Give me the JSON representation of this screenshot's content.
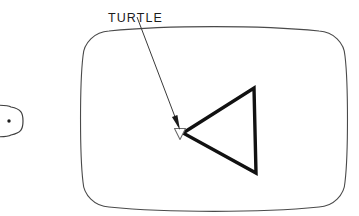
{
  "figure": {
    "background_color": "#ffffff",
    "annotation": {
      "label": "TURTLE",
      "label_x": 108,
      "label_y": 13,
      "leader_line": {
        "from_x": 137,
        "from_y": 17,
        "to_x": 180,
        "to_y": 129,
        "color": "#3a3a3a",
        "width": 1
      },
      "arrowhead": {
        "tip_x": 180,
        "tip_y": 130,
        "color": "#1a1a1a"
      }
    },
    "screen": {
      "name": "crt-screen",
      "outline_color": "#4a4a4a",
      "outline_width": 1.1,
      "fill": "#ffffff",
      "left": 83,
      "top": 30,
      "right": 345,
      "bottom": 208,
      "corner_radius": 26,
      "bow": 6
    },
    "turtle_cursor": {
      "name": "turtle-cursor",
      "shape": "triangle-down-outline",
      "center_x": 180,
      "center_y": 134,
      "size": 11,
      "stroke_color": "#6b6b6b",
      "fill": "#ffffff"
    },
    "drawn_path": {
      "name": "turtle-drawn-triangle",
      "shape": "triangle",
      "stroke_color": "#111111",
      "stroke_width": 3.4,
      "fill": "none",
      "points": [
        {
          "x": 183,
          "y": 133
        },
        {
          "x": 254,
          "y": 88
        },
        {
          "x": 256,
          "y": 173
        }
      ]
    },
    "adjacent_figure": {
      "name": "adjacent-screen-fragment",
      "description": "cut-off rounded screen outline with dot",
      "outline_color": "#3f3f3f",
      "outline_width": 1.2,
      "dot_x": 9,
      "dot_y": 121,
      "dot_radius": 1.7,
      "left": -26,
      "top": 106,
      "right": 23,
      "bottom": 136,
      "corner_radius": 12
    }
  }
}
